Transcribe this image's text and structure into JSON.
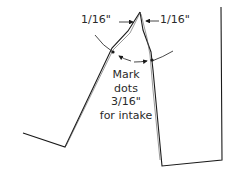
{
  "diagram": {
    "labels": {
      "left_measure": "1/16\"",
      "right_measure": "1/16\"",
      "note_lines": [
        "Mark",
        "dots",
        "3/16\"",
        "for intake"
      ]
    },
    "colors": {
      "line": "#1a1a1a",
      "background": "#ffffff"
    }
  }
}
